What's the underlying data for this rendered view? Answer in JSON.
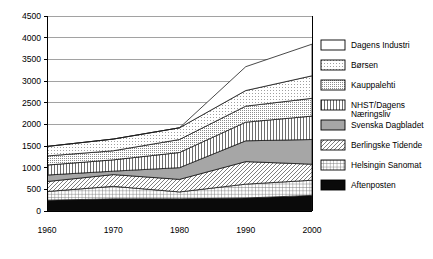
{
  "chart_data": {
    "type": "area",
    "stacked": true,
    "title": "",
    "subtitle": "",
    "xlabel": "",
    "ylabel": "",
    "x": [
      1960,
      1970,
      1980,
      1990,
      2000
    ],
    "xtick_labels": [
      "1960",
      "1970",
      "1980",
      "1990",
      "2000"
    ],
    "ytick_labels": [
      "0",
      "500",
      "1000",
      "1500",
      "2000",
      "2500",
      "3000",
      "3500",
      "4000",
      "4500"
    ],
    "ytick_values": [
      0,
      500,
      1000,
      1500,
      2000,
      2500,
      3000,
      3500,
      4000,
      4500
    ],
    "ylim": [
      0,
      4500
    ],
    "xlim": [
      1960,
      2000
    ],
    "grid": true,
    "legend_position": "right",
    "stack_order_bottom_to_top": [
      "Aftenposten",
      "Helsingin Sanomat",
      "Berlingske Tidende",
      "Svenska Dagbladet",
      "NHST/Dagens Naeringsliv",
      "Kauppalehti",
      "Borsen",
      "Dagens Industri"
    ],
    "series": [
      {
        "name": "Aftenposten",
        "pattern": "solid-dark",
        "values": [
          250,
          280,
          280,
          300,
          360
        ]
      },
      {
        "name": "Helsingin Sanomat",
        "pattern": "grid",
        "values": [
          200,
          290,
          160,
          320,
          350
        ]
      },
      {
        "name": "Berlingske Tidende",
        "pattern": "diagonal",
        "values": [
          230,
          270,
          290,
          520,
          370
        ]
      },
      {
        "name": "Svenska Dagbladet",
        "pattern": "solid-gray",
        "values": [
          150,
          80,
          270,
          480,
          570
        ]
      },
      {
        "name": "NHST/Dagens Naeringsliv",
        "pattern": "vertical",
        "values": [
          230,
          260,
          350,
          430,
          540
        ]
      },
      {
        "name": "Kauppalehti",
        "pattern": "stipple-dense",
        "values": [
          210,
          210,
          300,
          370,
          410
        ]
      },
      {
        "name": "Borsen",
        "pattern": "stipple-light",
        "values": [
          220,
          270,
          270,
          360,
          520
        ]
      },
      {
        "name": "Dagens Industri",
        "pattern": "blank",
        "values": [
          0,
          0,
          0,
          550,
          730
        ]
      }
    ],
    "cumulative_tops": {
      "Aftenposten": [
        250,
        280,
        280,
        300,
        360
      ],
      "Helsingin Sanomat": [
        450,
        570,
        440,
        620,
        710
      ],
      "Berlingske Tidende": [
        680,
        840,
        730,
        1140,
        1080
      ],
      "Svenska Dagbladet": [
        830,
        920,
        1000,
        1620,
        1650
      ],
      "NHST/Dagens Naeringsliv": [
        1060,
        1180,
        1350,
        2050,
        2190
      ],
      "Kauppalehti": [
        1270,
        1390,
        1650,
        2420,
        2600
      ],
      "Borsen": [
        1490,
        1660,
        1920,
        2780,
        3120
      ],
      "Dagens Industri": [
        1490,
        1660,
        1920,
        3330,
        3850
      ]
    }
  },
  "legend": {
    "items": [
      {
        "label": "Dagens Industri",
        "pattern": "blank"
      },
      {
        "label": "Børsen",
        "pattern": "stipple-light"
      },
      {
        "label": "Kauppalehti",
        "pattern": "stipple-dense"
      },
      {
        "label": "NHST/Dagens",
        "label2": "Næringsliv",
        "pattern": "vertical"
      },
      {
        "label": "Svenska Dagbladet",
        "pattern": "solid-gray"
      },
      {
        "label": "Berlingske Tidende",
        "pattern": "diagonal"
      },
      {
        "label": "Helsingin Sanomat",
        "pattern": "grid"
      },
      {
        "label": "Aftenposten",
        "pattern": "solid-dark"
      }
    ]
  },
  "colors": {
    "axis": "#000000",
    "grid": "#7a7a7a",
    "outline": "#1a1a1a",
    "solid_dark": "#000000",
    "solid_gray": "#9a9a9a",
    "background": "#ffffff"
  }
}
